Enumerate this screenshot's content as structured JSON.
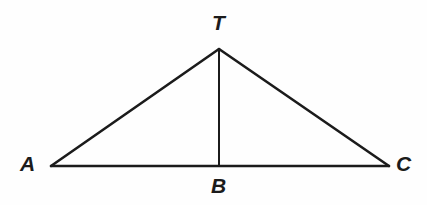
{
  "figure": {
    "background_color": "#fefefe",
    "stroke_color": "#1b1b1b",
    "label_color": "#1b1b1b",
    "width": 427,
    "height": 205,
    "points": {
      "A": {
        "label": "A",
        "x": 51,
        "y": 166
      },
      "T": {
        "label": "T",
        "x": 219,
        "y": 49
      },
      "B": {
        "label": "B",
        "x": 219,
        "y": 166
      },
      "C": {
        "label": "C",
        "x": 389,
        "y": 166
      }
    },
    "segments": [
      {
        "name": "AT",
        "from": "A",
        "to": "T",
        "stroke_width": 2.6
      },
      {
        "name": "TC",
        "from": "T",
        "to": "C",
        "stroke_width": 2.6
      },
      {
        "name": "AC",
        "from": "A",
        "to": "C",
        "stroke_width": 2.4
      },
      {
        "name": "TB",
        "from": "T",
        "to": "B",
        "stroke_width": 2.0
      }
    ]
  }
}
